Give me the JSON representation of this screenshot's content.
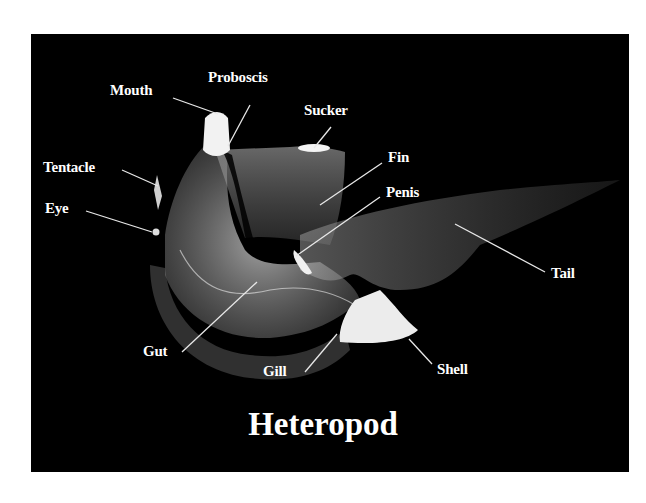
{
  "figure": {
    "title": "Heteropod",
    "background_color": "#000000",
    "label_color": "#ffffff",
    "labels": [
      {
        "id": "mouth",
        "text": "Mouth"
      },
      {
        "id": "proboscis",
        "text": "Proboscis"
      },
      {
        "id": "sucker",
        "text": "Sucker"
      },
      {
        "id": "fin",
        "text": "Fin"
      },
      {
        "id": "penis",
        "text": "Penis"
      },
      {
        "id": "tentacle",
        "text": "Tentacle"
      },
      {
        "id": "eye",
        "text": "Eye"
      },
      {
        "id": "tail",
        "text": "Tail"
      },
      {
        "id": "gut",
        "text": "Gut"
      },
      {
        "id": "gill",
        "text": "Gill"
      },
      {
        "id": "shell",
        "text": "Shell"
      }
    ]
  }
}
